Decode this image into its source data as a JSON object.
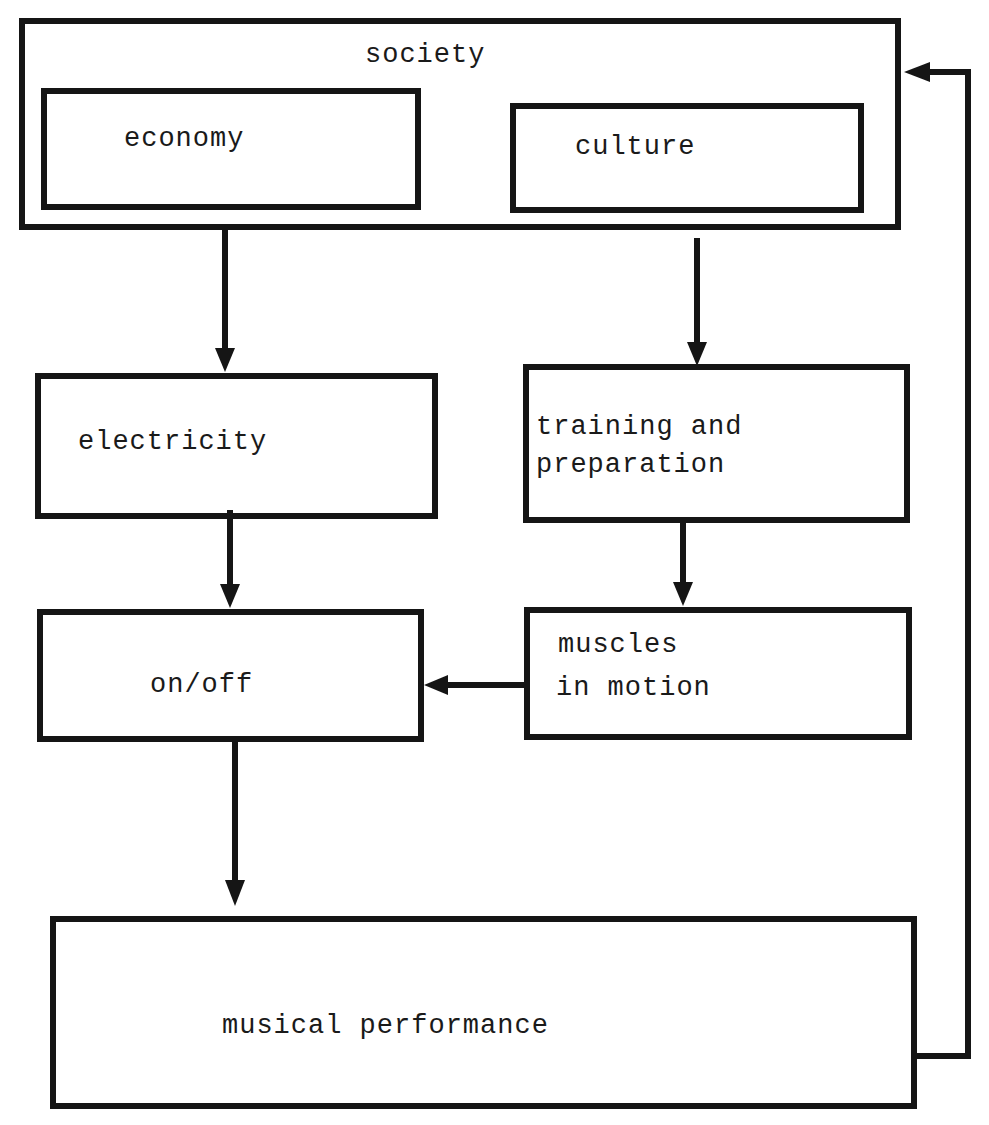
{
  "diagram": {
    "nodes": {
      "society": {
        "label": "society"
      },
      "economy": {
        "label": "economy"
      },
      "culture": {
        "label": "culture"
      },
      "electricity": {
        "label": "electricity"
      },
      "training": {
        "line1": "training and",
        "line2": "preparation"
      },
      "onoff": {
        "label": "on/off"
      },
      "muscles": {
        "line1": "muscles",
        "line2": "in motion"
      },
      "performance": {
        "label": "musical performance"
      }
    },
    "edges": [
      {
        "from": "economy",
        "to": "electricity"
      },
      {
        "from": "culture",
        "to": "training and preparation"
      },
      {
        "from": "electricity",
        "to": "on/off"
      },
      {
        "from": "training and preparation",
        "to": "muscles in motion"
      },
      {
        "from": "muscles in motion",
        "to": "on/off"
      },
      {
        "from": "on/off",
        "to": "musical performance"
      },
      {
        "from": "musical performance",
        "to": "society"
      }
    ],
    "colors": {
      "stroke": "#151515",
      "background": "#ffffff"
    }
  }
}
